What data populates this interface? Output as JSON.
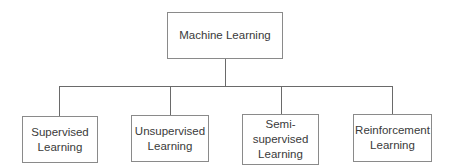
{
  "diagram": {
    "type": "tree",
    "root": {
      "label": "Machine Learning"
    },
    "children": [
      {
        "label": "Supervised\nLearning"
      },
      {
        "label": "Unsupervised\nLearning"
      },
      {
        "label": "Semi-\nsupervised\nLearning"
      },
      {
        "label": "Reinforcement\nLearning"
      }
    ],
    "colors": {
      "line": "#6a6a6a",
      "border": "#8a8a8a",
      "text": "#3a3a3a",
      "background": "#ffffff"
    }
  }
}
